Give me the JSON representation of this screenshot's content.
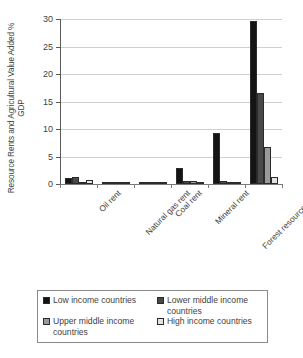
{
  "chart_data": {
    "type": "bar",
    "title": "",
    "xlabel": "",
    "ylabel": "Resource Rents and Agricultural Value Added % GDP",
    "ylim": [
      0,
      30
    ],
    "yticks": [
      0,
      5,
      10,
      15,
      20,
      25,
      30
    ],
    "ytick_labels": [
      "0",
      "5",
      "10",
      "15",
      "20",
      "25",
      "30"
    ],
    "grid": "horizontal",
    "legend_position": "bottom",
    "categories": [
      "Oil rent",
      "Natural gas rent",
      "Coal rent",
      "Mineral rent",
      "Forest resources rent",
      "Agricultural value added"
    ],
    "series": [
      {
        "name": "Low income countries",
        "color": "#141414",
        "values": [
          1.1,
          0.15,
          0.1,
          2.9,
          9.3,
          29.7
        ]
      },
      {
        "name": "Lower middle income countries",
        "color": "#494949",
        "values": [
          1.2,
          0.35,
          0.4,
          0.55,
          0.6,
          16.5
        ]
      },
      {
        "name": "Upper middle income countries",
        "color": "#9a9a9a",
        "values": [
          0.3,
          0.25,
          0.3,
          0.55,
          0.2,
          6.7
        ]
      },
      {
        "name": "High income countries",
        "color": "#e3e3e3",
        "values": [
          0.75,
          0.1,
          0.05,
          0.2,
          0.12,
          1.2
        ]
      }
    ]
  },
  "legend": {
    "entries": [
      {
        "label": "Low income countries",
        "color": "#141414"
      },
      {
        "label": "Lower middle income countries",
        "color": "#494949"
      },
      {
        "label": "Upper middle income countries",
        "color": "#9a9a9a"
      },
      {
        "label": "High income countries",
        "color": "#e3e3e3"
      }
    ]
  }
}
